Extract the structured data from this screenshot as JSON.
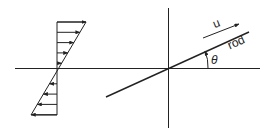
{
  "diagram": {
    "left": {
      "name": "linear shear velocity profile",
      "arrow_count_upper": 8,
      "arrow_count_lower": 7
    },
    "right": {
      "labels": {
        "velocity": "u",
        "rod": "rod",
        "angle": "θ"
      }
    },
    "colors": {
      "stroke": "#222222",
      "background": "#ffffff"
    }
  }
}
